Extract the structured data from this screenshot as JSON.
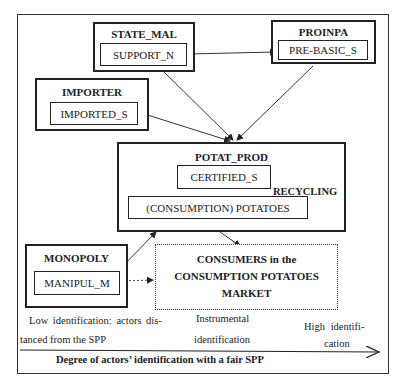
{
  "nodes": {
    "state_mal": {
      "title": "STATE_MAL",
      "inner": "SUPPORT_N"
    },
    "proinpa": {
      "title": "PROINPA",
      "inner": "PRE-BASIC_S"
    },
    "importer": {
      "title": "IMPORTER",
      "inner": "IMPORTED_S"
    },
    "potat_prod": {
      "title": "POTAT_PROD",
      "certified": "CERTIFIED_S",
      "potatoes": "(CONSUMPTION) POTATOES",
      "recycling": "RECYCLING"
    },
    "monopoly": {
      "title": "MONOPOLY",
      "inner": "MANIPUL_M"
    },
    "consumers": {
      "line1": "CONSUMERS in the",
      "line2": "CONSUMPTION POTATOES",
      "line3": "MARKET"
    }
  },
  "edges": [
    {
      "from": "SUPPORT_N",
      "to": "PRE-BASIC_S",
      "style": "solid"
    },
    {
      "from": "SUPPORT_N",
      "to": "POTAT_PROD",
      "style": "solid"
    },
    {
      "from": "PRE-BASIC_S",
      "to": "POTAT_PROD",
      "style": "solid"
    },
    {
      "from": "IMPORTED_S",
      "to": "POTAT_PROD",
      "style": "solid"
    },
    {
      "from": "CERTIFIED_S",
      "to": "(CONSUMPTION) POTATOES",
      "style": "solid"
    },
    {
      "from": "(CONSUMPTION) POTATOES",
      "to": "CERTIFIED_S",
      "style": "solid",
      "label": "RECYCLING"
    },
    {
      "from": "POTAT_PROD",
      "to": "CONSUMERS",
      "style": "solid"
    },
    {
      "from": "MANIPUL_M",
      "to": "POTAT_PROD",
      "style": "solid"
    },
    {
      "from": "MANIPUL_M",
      "to": "CONSUMERS",
      "style": "dotted"
    }
  ],
  "axis": {
    "low_line1": "Low identification: actors dis-",
    "low_line2": "tanced from the SPP",
    "mid_line1": "Instrumental",
    "mid_line2": "identification",
    "high_line1": "High identifi-",
    "high_line2": "cation",
    "caption": "Degree of actors’ identification with a fair SPP"
  }
}
